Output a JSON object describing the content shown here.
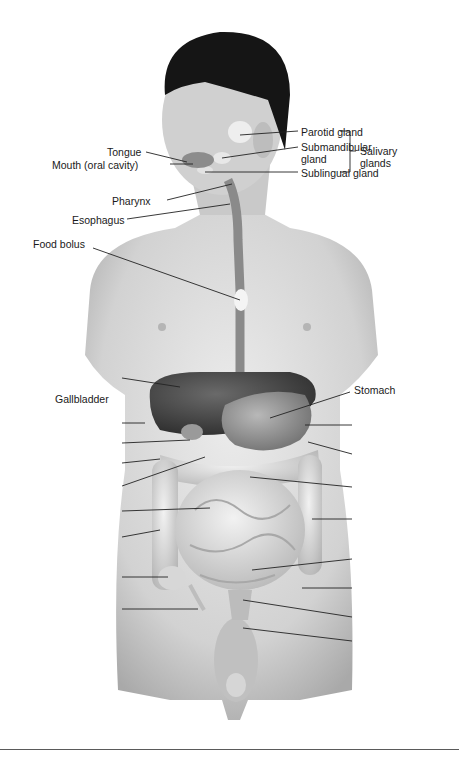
{
  "figure": {
    "colors": {
      "skin": "#d9d9d9",
      "hair": "#151515",
      "liver": "#4d4d4d",
      "stomach": "#8a8a8a",
      "intestine": "#e6e6e6",
      "line": "#222222"
    }
  },
  "labels": {
    "tongue": "Tongue",
    "mouth": "Mouth (oral cavity)",
    "pharynx": "Pharynx",
    "esophagus": "Esophagus",
    "food_bolus": "Food bolus",
    "parotid": "Parotid gland",
    "submandibular_1": "Submandibular",
    "submandibular_2": "gland",
    "sublingual": "Sublingual gland",
    "salivary_1": "Salivary",
    "salivary_2": "glands",
    "gallbladder": "Gallbladder",
    "stomach": "Stomach"
  },
  "blank_leaders": {
    "left_count": 8,
    "right_count": 8
  }
}
